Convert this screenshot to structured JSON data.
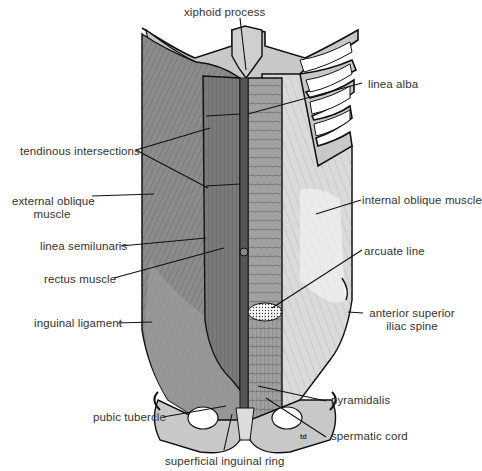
{
  "figure": {
    "labels": {
      "xiphoid_process": "xiphoid process",
      "linea_alba": "linea alba",
      "tendinous_intersections": "tendinous intersections",
      "external_oblique_1": "external oblique",
      "external_oblique_2": "muscle",
      "internal_oblique": "internal oblique muscle",
      "linea_semilunaris": "linea semilunaris",
      "arcuate_line": "arcuate line",
      "rectus_muscle": "rectus muscle",
      "asis_1": "anterior superior",
      "asis_2": "iliac spine",
      "inguinal_ligament": "inguinal ligament",
      "pyramidalis": "pyramidalis",
      "pubic_tubercle": "pubic tubercle",
      "spermatic_cord": "spermatic cord",
      "superficial_inguinal_ring": "superficial inguinal ring",
      "signature": "td"
    },
    "colors": {
      "muscle_dark": "#6e6e6e",
      "muscle_mid": "#8c8c8c",
      "muscle_light": "#b5b5b5",
      "internal_oblique": "#d9d9d9",
      "bone": "#c8c8c8",
      "outline": "#111111",
      "background": "#ffffff"
    }
  }
}
